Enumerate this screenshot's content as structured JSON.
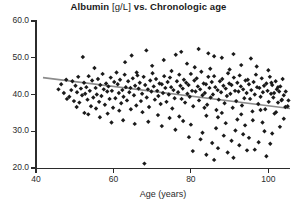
{
  "chart_data": {
    "type": "scatter",
    "title": "Albumin [g/L] vs. Chronologic age",
    "title_main": "Albumin",
    "title_unit": "[g/L]",
    "title_rest": "vs. Chronologic age",
    "xlabel": "Age (years)",
    "ylabel": "",
    "xlim": [
      40,
      105.6
    ],
    "ylim": [
      20.0,
      60.0
    ],
    "grid": false,
    "legend": null,
    "marker": "diamond",
    "marker_color": "#1a1a1a",
    "marker_size": 3.2,
    "xticks": [
      40,
      60,
      80,
      100
    ],
    "xtick_labels": [
      "40",
      "60",
      "80",
      "100"
    ],
    "yticks": [
      20.0,
      30.0,
      40.0,
      50.0,
      60.0
    ],
    "ytick_labels": [
      "20.0",
      "30.0",
      "40.0",
      "50.0",
      "60.0"
    ],
    "trendline": {
      "color": "#8c8c8c",
      "width": 1.6,
      "x": [
        41.8,
        105.6
      ],
      "y": [
        44.6,
        36.2
      ]
    },
    "points": [
      [
        48.6,
        39.4
      ],
      [
        49.1,
        41.2
      ],
      [
        49.4,
        43.6
      ],
      [
        49.8,
        38.2
      ],
      [
        50.2,
        42.4
      ],
      [
        50.6,
        40.6
      ],
      [
        50.9,
        44.8
      ],
      [
        51.2,
        37.8
      ],
      [
        51.6,
        41.6
      ],
      [
        51.9,
        39.8
      ],
      [
        52.1,
        50.2
      ],
      [
        52.4,
        43.2
      ],
      [
        52.7,
        40.2
      ],
      [
        53.0,
        42.0
      ],
      [
        53.3,
        38.6
      ],
      [
        53.6,
        45.0
      ],
      [
        53.9,
        41.0
      ],
      [
        54.2,
        36.8
      ],
      [
        54.5,
        43.8
      ],
      [
        54.8,
        39.2
      ],
      [
        55.1,
        47.2
      ],
      [
        55.4,
        41.8
      ],
      [
        55.7,
        40.0
      ],
      [
        56.0,
        44.2
      ],
      [
        56.3,
        38.0
      ],
      [
        56.6,
        42.6
      ],
      [
        56.9,
        39.6
      ],
      [
        57.2,
        45.6
      ],
      [
        57.5,
        41.4
      ],
      [
        57.8,
        37.2
      ],
      [
        58.1,
        43.0
      ],
      [
        58.4,
        40.8
      ],
      [
        58.7,
        42.2
      ],
      [
        59.0,
        38.8
      ],
      [
        59.3,
        44.6
      ],
      [
        59.6,
        41.0
      ],
      [
        59.9,
        36.4
      ],
      [
        60.2,
        43.4
      ],
      [
        60.5,
        39.0
      ],
      [
        60.8,
        46.0
      ],
      [
        61.1,
        42.8
      ],
      [
        61.4,
        40.4
      ],
      [
        61.7,
        44.0
      ],
      [
        62.0,
        37.6
      ],
      [
        62.3,
        41.2
      ],
      [
        62.6,
        39.4
      ],
      [
        62.9,
        45.4
      ],
      [
        63.2,
        42.0
      ],
      [
        63.5,
        38.4
      ],
      [
        63.8,
        43.6
      ],
      [
        64.1,
        40.6
      ],
      [
        64.4,
        41.8
      ],
      [
        64.7,
        50.6
      ],
      [
        65.0,
        44.4
      ],
      [
        65.3,
        39.8
      ],
      [
        65.6,
        42.4
      ],
      [
        65.9,
        37.0
      ],
      [
        66.2,
        45.2
      ],
      [
        66.5,
        41.6
      ],
      [
        66.8,
        43.2
      ],
      [
        67.1,
        38.2
      ],
      [
        67.4,
        40.2
      ],
      [
        67.8,
        44.8
      ],
      [
        68.0,
        21.2
      ],
      [
        68.2,
        42.6
      ],
      [
        68.6,
        39.2
      ],
      [
        68.9,
        41.4
      ],
      [
        69.2,
        36.6
      ],
      [
        69.5,
        43.8
      ],
      [
        69.8,
        40.8
      ],
      [
        70.1,
        45.8
      ],
      [
        70.4,
        42.2
      ],
      [
        70.7,
        38.6
      ],
      [
        71.0,
        44.2
      ],
      [
        71.3,
        41.0
      ],
      [
        71.6,
        39.6
      ],
      [
        71.9,
        43.0
      ],
      [
        72.2,
        37.4
      ],
      [
        72.5,
        42.8
      ],
      [
        72.8,
        40.4
      ],
      [
        73.1,
        45.0
      ],
      [
        73.4,
        41.8
      ],
      [
        73.7,
        38.0
      ],
      [
        74.0,
        43.4
      ],
      [
        74.3,
        40.0
      ],
      [
        74.6,
        44.6
      ],
      [
        74.9,
        42.0
      ],
      [
        75.2,
        36.2
      ],
      [
        75.5,
        41.2
      ],
      [
        75.8,
        39.0
      ],
      [
        76.1,
        50.8
      ],
      [
        76.4,
        43.6
      ],
      [
        76.7,
        40.6
      ],
      [
        77.0,
        45.4
      ],
      [
        77.3,
        42.4
      ],
      [
        77.6,
        38.8
      ],
      [
        77.9,
        41.6
      ],
      [
        78.2,
        44.0
      ],
      [
        78.5,
        37.8
      ],
      [
        78.8,
        43.2
      ],
      [
        79.1,
        40.2
      ],
      [
        79.4,
        42.6
      ],
      [
        79.7,
        39.4
      ],
      [
        80.0,
        45.6
      ],
      [
        80.3,
        41.0
      ],
      [
        80.6,
        36.8
      ],
      [
        80.9,
        43.8
      ],
      [
        81.2,
        40.8
      ],
      [
        81.5,
        44.4
      ],
      [
        81.8,
        42.2
      ],
      [
        82.1,
        38.4
      ],
      [
        82.4,
        41.4
      ],
      [
        82.7,
        46.2
      ],
      [
        83.0,
        39.8
      ],
      [
        83.3,
        43.0
      ],
      [
        83.6,
        40.4
      ],
      [
        83.9,
        42.8
      ],
      [
        84.2,
        37.2
      ],
      [
        84.5,
        44.8
      ],
      [
        84.8,
        41.8
      ],
      [
        85.1,
        39.2
      ],
      [
        85.4,
        43.4
      ],
      [
        85.7,
        40.0
      ],
      [
        86.0,
        45.0
      ],
      [
        86.3,
        42.0
      ],
      [
        86.6,
        35.8
      ],
      [
        86.9,
        41.2
      ],
      [
        87.2,
        38.6
      ],
      [
        87.5,
        43.6
      ],
      [
        87.8,
        40.6
      ],
      [
        88.1,
        44.2
      ],
      [
        88.4,
        42.4
      ],
      [
        88.7,
        37.6
      ],
      [
        89.0,
        41.6
      ],
      [
        89.3,
        39.6
      ],
      [
        89.6,
        45.8
      ],
      [
        89.9,
        43.0
      ],
      [
        90.2,
        40.2
      ],
      [
        90.5,
        42.6
      ],
      [
        90.8,
        36.4
      ],
      [
        91.1,
        44.6
      ],
      [
        91.4,
        41.0
      ],
      [
        91.7,
        38.2
      ],
      [
        92.0,
        43.2
      ],
      [
        92.3,
        40.8
      ],
      [
        92.6,
        45.2
      ],
      [
        92.9,
        42.2
      ],
      [
        93.2,
        37.0
      ],
      [
        93.5,
        41.4
      ],
      [
        93.8,
        39.0
      ],
      [
        94.1,
        43.8
      ],
      [
        94.4,
        40.4
      ],
      [
        94.7,
        44.0
      ],
      [
        95.0,
        42.8
      ],
      [
        95.3,
        38.8
      ],
      [
        95.6,
        41.2
      ],
      [
        95.9,
        35.4
      ],
      [
        96.2,
        43.4
      ],
      [
        96.5,
        40.0
      ],
      [
        96.8,
        45.4
      ],
      [
        97.1,
        42.0
      ],
      [
        97.4,
        37.4
      ],
      [
        97.7,
        41.8
      ],
      [
        98.0,
        39.4
      ],
      [
        98.3,
        44.4
      ],
      [
        98.6,
        40.6
      ],
      [
        98.9,
        42.4
      ],
      [
        99.2,
        36.0
      ],
      [
        99.5,
        43.0
      ],
      [
        99.8,
        41.0
      ],
      [
        100.1,
        38.0
      ],
      [
        100.4,
        44.8
      ],
      [
        100.7,
        40.2
      ],
      [
        101.0,
        42.6
      ],
      [
        101.3,
        39.2
      ],
      [
        101.6,
        34.8
      ],
      [
        101.9,
        43.6
      ],
      [
        102.2,
        41.4
      ],
      [
        102.5,
        37.8
      ],
      [
        102.8,
        40.8
      ],
      [
        103.1,
        42.2
      ],
      [
        103.4,
        38.4
      ],
      [
        103.7,
        44.2
      ],
      [
        104.0,
        39.8
      ],
      [
        104.4,
        36.6
      ],
      [
        82.0,
        52.4
      ],
      [
        84.5,
        51.2
      ],
      [
        77.5,
        51.6
      ],
      [
        68.5,
        52.0
      ],
      [
        91.0,
        51.0
      ],
      [
        86.0,
        50.4
      ],
      [
        95.5,
        49.8
      ],
      [
        88.0,
        50.0
      ],
      [
        73.0,
        49.4
      ],
      [
        63.0,
        48.8
      ],
      [
        79.0,
        48.4
      ],
      [
        93.0,
        48.0
      ],
      [
        97.0,
        47.6
      ],
      [
        70.0,
        47.8
      ],
      [
        85.0,
        47.0
      ],
      [
        90.0,
        46.8
      ],
      [
        75.0,
        46.4
      ],
      [
        100.0,
        46.6
      ],
      [
        66.0,
        46.0
      ],
      [
        81.0,
        47.4
      ],
      [
        87.0,
        33.8
      ],
      [
        92.0,
        33.2
      ],
      [
        78.0,
        32.8
      ],
      [
        84.0,
        34.2
      ],
      [
        96.0,
        33.0
      ],
      [
        89.0,
        32.2
      ],
      [
        94.0,
        31.6
      ],
      [
        80.0,
        31.8
      ],
      [
        86.5,
        30.8
      ],
      [
        91.5,
        30.2
      ],
      [
        98.5,
        32.4
      ],
      [
        83.0,
        29.6
      ],
      [
        88.5,
        28.8
      ],
      [
        93.5,
        29.2
      ],
      [
        76.0,
        30.4
      ],
      [
        99.0,
        30.0
      ],
      [
        95.0,
        28.2
      ],
      [
        90.5,
        27.4
      ],
      [
        85.5,
        26.8
      ],
      [
        97.5,
        27.0
      ],
      [
        101.0,
        29.4
      ],
      [
        79.5,
        28.4
      ],
      [
        92.5,
        26.2
      ],
      [
        87.0,
        25.4
      ],
      [
        82.5,
        27.8
      ],
      [
        100.5,
        26.6
      ],
      [
        94.5,
        24.8
      ],
      [
        89.5,
        24.2
      ],
      [
        84.0,
        23.6
      ],
      [
        96.5,
        25.0
      ],
      [
        91.0,
        22.8
      ],
      [
        86.0,
        22.2
      ],
      [
        99.5,
        23.2
      ],
      [
        80.5,
        24.6
      ],
      [
        103.0,
        31.2
      ],
      [
        104.0,
        33.4
      ],
      [
        102.0,
        35.2
      ],
      [
        105.0,
        36.8
      ],
      [
        103.5,
        38.6
      ],
      [
        74.5,
        33.6
      ],
      [
        71.5,
        34.4
      ],
      [
        67.5,
        35.2
      ],
      [
        64.5,
        36.0
      ],
      [
        61.5,
        35.6
      ],
      [
        58.5,
        34.8
      ],
      [
        55.5,
        36.2
      ],
      [
        52.5,
        35.0
      ],
      [
        50.5,
        36.6
      ],
      [
        69.0,
        32.6
      ],
      [
        72.5,
        31.4
      ],
      [
        65.5,
        32.0
      ],
      [
        62.5,
        33.0
      ],
      [
        59.5,
        32.4
      ],
      [
        56.5,
        33.8
      ],
      [
        53.5,
        34.6
      ],
      [
        77.0,
        34.0
      ],
      [
        83.5,
        36.4
      ],
      [
        88.0,
        35.0
      ],
      [
        93.0,
        34.6
      ],
      [
        98.0,
        35.8
      ],
      [
        101.5,
        40.4
      ],
      [
        102.5,
        42.0
      ],
      [
        104.5,
        40.8
      ],
      [
        105.2,
        38.4
      ],
      [
        100.8,
        43.2
      ],
      [
        46.5,
        42.8
      ],
      [
        47.2,
        40.4
      ],
      [
        47.8,
        44.0
      ],
      [
        48.0,
        38.8
      ],
      [
        45.8,
        41.4
      ]
    ]
  }
}
